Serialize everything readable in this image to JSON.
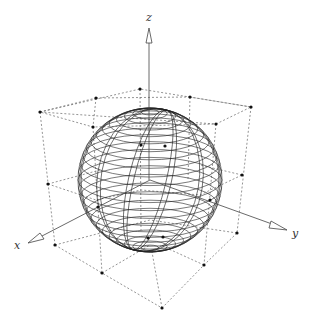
{
  "figure": {
    "axes": {
      "x_label": "x",
      "y_label": "y",
      "z_label": "z"
    },
    "colors": {
      "background": "#ffffff",
      "sphere_lines": "#222222",
      "cube_dashes": "#555555",
      "points": "#111111",
      "axis": "#444444"
    }
  }
}
